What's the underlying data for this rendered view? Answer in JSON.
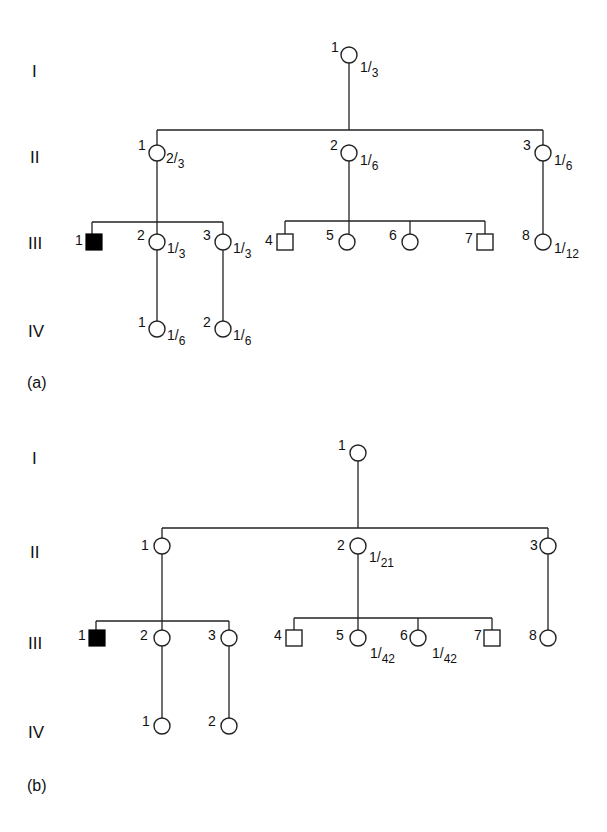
{
  "figure": {
    "panels": [
      {
        "label": "(a)",
        "generations": [
          "I",
          "II",
          "III",
          "IV"
        ],
        "individuals": {
          "I": [
            {
              "id": "1",
              "sex": "female",
              "affected": false,
              "prob_num": "1",
              "prob_den": "3"
            }
          ],
          "II": [
            {
              "id": "1",
              "sex": "female",
              "affected": false,
              "prob_num": "2",
              "prob_den": "3"
            },
            {
              "id": "2",
              "sex": "female",
              "affected": false,
              "prob_num": "1",
              "prob_den": "6"
            },
            {
              "id": "3",
              "sex": "female",
              "affected": false,
              "prob_num": "1",
              "prob_den": "6"
            }
          ],
          "III": [
            {
              "id": "1",
              "sex": "male",
              "affected": true
            },
            {
              "id": "2",
              "sex": "female",
              "affected": false,
              "prob_num": "1",
              "prob_den": "3"
            },
            {
              "id": "3",
              "sex": "female",
              "affected": false,
              "prob_num": "1",
              "prob_den": "3"
            },
            {
              "id": "4",
              "sex": "male",
              "affected": false
            },
            {
              "id": "5",
              "sex": "female",
              "affected": false
            },
            {
              "id": "6",
              "sex": "female",
              "affected": false
            },
            {
              "id": "7",
              "sex": "male",
              "affected": false
            },
            {
              "id": "8",
              "sex": "female",
              "affected": false,
              "prob_num": "1",
              "prob_den": "12"
            }
          ],
          "IV": [
            {
              "id": "1",
              "sex": "female",
              "affected": false,
              "prob_num": "1",
              "prob_den": "6"
            },
            {
              "id": "2",
              "sex": "female",
              "affected": false,
              "prob_num": "1",
              "prob_den": "6"
            }
          ]
        }
      },
      {
        "label": "(b)",
        "generations": [
          "I",
          "II",
          "III",
          "IV"
        ],
        "individuals": {
          "I": [
            {
              "id": "1",
              "sex": "female",
              "affected": false
            }
          ],
          "II": [
            {
              "id": "1",
              "sex": "female",
              "affected": false
            },
            {
              "id": "2",
              "sex": "female",
              "affected": false,
              "prob_num": "1",
              "prob_den": "21"
            },
            {
              "id": "3",
              "sex": "female",
              "affected": false
            }
          ],
          "III": [
            {
              "id": "1",
              "sex": "male",
              "affected": true
            },
            {
              "id": "2",
              "sex": "female",
              "affected": false
            },
            {
              "id": "3",
              "sex": "female",
              "affected": false
            },
            {
              "id": "4",
              "sex": "male",
              "affected": false
            },
            {
              "id": "5",
              "sex": "female",
              "affected": false,
              "prob_num": "1",
              "prob_den": "42"
            },
            {
              "id": "6",
              "sex": "female",
              "affected": false,
              "prob_num": "1",
              "prob_den": "42"
            },
            {
              "id": "7",
              "sex": "male",
              "affected": false
            },
            {
              "id": "8",
              "sex": "female",
              "affected": false
            }
          ],
          "IV": [
            {
              "id": "1",
              "sex": "female",
              "affected": false
            },
            {
              "id": "2",
              "sex": "female",
              "affected": false
            }
          ]
        }
      }
    ]
  },
  "colors": {
    "line": "#222222",
    "affected_fill": "#000000",
    "background": "#ffffff"
  }
}
